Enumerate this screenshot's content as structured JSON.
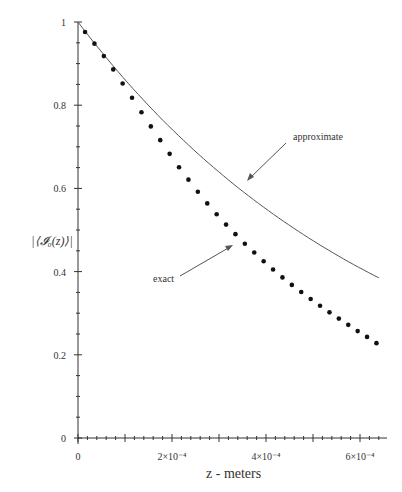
{
  "chart_data": {
    "type": "line",
    "title": "",
    "xlabel": "z - meters",
    "ylabel": "|⟨𝓘₀(z)⟩|",
    "xlim": [
      0,
      0.00066
    ],
    "ylim": [
      0,
      1
    ],
    "x_ticks": [
      {
        "v": 0,
        "label": "0"
      },
      {
        "v": 0.0002,
        "label": "2×10⁻⁴"
      },
      {
        "v": 0.0004,
        "label": "4×10⁻⁴"
      },
      {
        "v": 0.0006,
        "label": "6×10⁻⁴"
      }
    ],
    "y_ticks": [
      {
        "v": 0,
        "label": "0"
      },
      {
        "v": 0.2,
        "label": "0.2"
      },
      {
        "v": 0.4,
        "label": "0.4"
      },
      {
        "v": 0.6,
        "label": "0.6"
      },
      {
        "v": 0.8,
        "label": "0.8"
      },
      {
        "v": 1,
        "label": "1"
      }
    ],
    "grid": false,
    "series": [
      {
        "name": "approximate",
        "style": "line",
        "x_start": 0,
        "x_end": 0.00064,
        "y_start": 1.0,
        "y_end": 0.385
      },
      {
        "name": "exact",
        "style": "dots",
        "x": [
          1.5e-05,
          3.5e-05,
          5.5e-05,
          7.5e-05,
          9.5e-05,
          0.000115,
          0.000135,
          0.000155,
          0.000175,
          0.000195,
          0.000215,
          0.000235,
          0.000255,
          0.000275,
          0.000295,
          0.000315,
          0.000335,
          0.000355,
          0.000375,
          0.000395,
          0.000415,
          0.000435,
          0.000455,
          0.000475,
          0.000495,
          0.000515,
          0.000535,
          0.000555,
          0.000575,
          0.000595,
          0.000615,
          0.000635
        ],
        "values": [
          0.976,
          0.948,
          0.918,
          0.886,
          0.852,
          0.818,
          0.783,
          0.749,
          0.716,
          0.683,
          0.651,
          0.621,
          0.592,
          0.564,
          0.538,
          0.513,
          0.49,
          0.467,
          0.446,
          0.425,
          0.405,
          0.386,
          0.368,
          0.351,
          0.334,
          0.318,
          0.302,
          0.287,
          0.272,
          0.257,
          0.243,
          0.228
        ]
      }
    ],
    "annotations": [
      {
        "text": "approximate",
        "x": 293,
        "y": 140
      },
      {
        "text": "exact",
        "x": 153,
        "y": 282
      }
    ]
  }
}
